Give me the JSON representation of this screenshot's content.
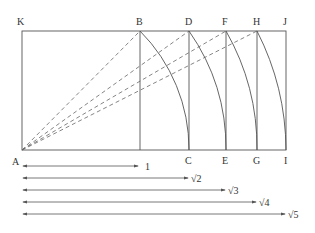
{
  "diagram": {
    "colors": {
      "line": "#555555",
      "text": "#333333",
      "background": "#ffffff"
    },
    "rectangle": {
      "left": 22,
      "top": 31,
      "right": 286,
      "bottom": 150
    },
    "points": {
      "A": {
        "label": "A",
        "x": 22,
        "y": 150
      },
      "K": {
        "label": "K",
        "x": 22,
        "y": 31
      },
      "B": {
        "label": "B",
        "x": 140,
        "y": 31
      },
      "D": {
        "label": "D",
        "x": 189,
        "y": 31
      },
      "F": {
        "label": "F",
        "x": 226,
        "y": 31
      },
      "H": {
        "label": "H",
        "x": 257,
        "y": 31
      },
      "J": {
        "label": "J",
        "x": 286,
        "y": 31
      },
      "C": {
        "label": "C",
        "x": 189,
        "y": 150
      },
      "E": {
        "label": "E",
        "x": 226,
        "y": 150
      },
      "G": {
        "label": "G",
        "x": 257,
        "y": 150
      },
      "I": {
        "label": "I",
        "x": 286,
        "y": 150
      }
    },
    "arrows": [
      {
        "label": "1",
        "end": 138,
        "y": 166
      },
      {
        "label": "√2",
        "end": 188,
        "y": 178
      },
      {
        "label": "√3",
        "end": 225,
        "y": 190
      },
      {
        "label": "√4",
        "end": 256,
        "y": 202
      },
      {
        "label": "√5",
        "end": 285,
        "y": 214
      }
    ]
  }
}
